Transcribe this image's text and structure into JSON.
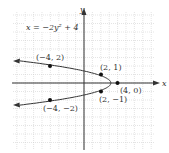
{
  "chart_data": {
    "type": "line",
    "title": "",
    "equation": "x = −2y² + 4",
    "xlabel": "x",
    "ylabel": "y",
    "xlim": [
      -8,
      8
    ],
    "ylim": [
      -8,
      8
    ],
    "grid": true,
    "curve": "x = -2y^2 + 4 (parabola opening left)",
    "points": [
      {
        "x": -4,
        "y": 2,
        "label": "(−4, 2)"
      },
      {
        "x": 2,
        "y": 1,
        "label": "(2, 1)"
      },
      {
        "x": 4,
        "y": 0,
        "label": "(4, 0)"
      },
      {
        "x": 2,
        "y": -1,
        "label": "(2, −1)"
      },
      {
        "x": -4,
        "y": -2,
        "label": "(−4, −2)"
      }
    ]
  },
  "labels": {
    "equation": "x = −2y² + 4",
    "x_axis": "x",
    "y_axis": "y",
    "p1": "(−4, 2)",
    "p2": "(2, 1)",
    "p3": "(4, 0)",
    "p4": "(2, −1)",
    "p5": "(−4, −2)"
  }
}
